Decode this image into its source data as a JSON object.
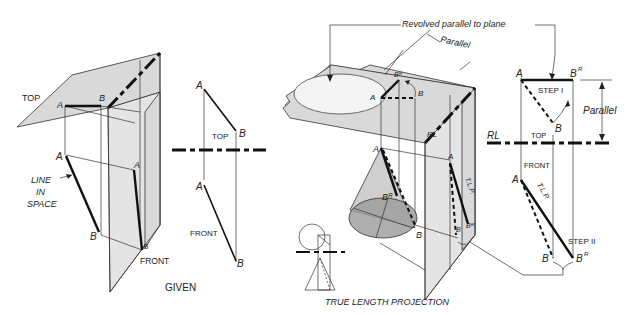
{
  "figure": {
    "left_panel": {
      "caption": "GIVEN",
      "pictorial": {
        "plane_labels": {
          "top": "TOP",
          "front": "FRONT"
        },
        "points": {
          "a_top": "A",
          "b_top": "B",
          "a_front": "A",
          "b_front": "B",
          "a_side": "A",
          "b_side": "B"
        },
        "annotation": [
          "LINE",
          "IN",
          "SPACE"
        ]
      },
      "orthographic": {
        "top_label": "TOP",
        "front_label": "FRONT",
        "points": {
          "a_top": "A",
          "b_top": "B",
          "a_front": "A",
          "b_front": "B"
        }
      }
    },
    "right_panel": {
      "caption": "TRUE LENGTH PROJECTION",
      "callout": "Revolved parallel to plane",
      "pictorial": {
        "parallel_label": "Parallel",
        "rl_label": "RL",
        "points": {
          "a_top": "A",
          "b_top": "B",
          "br_top": "Bᴿ",
          "a_front": "A",
          "b_front": "B",
          "br_front": "Bᴿ",
          "a_side": "A",
          "b_side": "B",
          "br_side": "Bᴿ"
        },
        "tlp_label": "T.L.P."
      },
      "orthographic": {
        "rl_label": "RL",
        "top_label": "TOP",
        "front_label": "FRONT",
        "step1": "STEP I",
        "step2": "STEP II",
        "parallel_label": "Parallel",
        "tlp_label": "T.L.P.",
        "points": {
          "a_top": "A",
          "b_top": "B",
          "br_top": "B",
          "br_sup": "R",
          "a_front": "A",
          "b_front": "B",
          "br_front": "B",
          "br_front_sup": "R"
        }
      }
    }
  }
}
